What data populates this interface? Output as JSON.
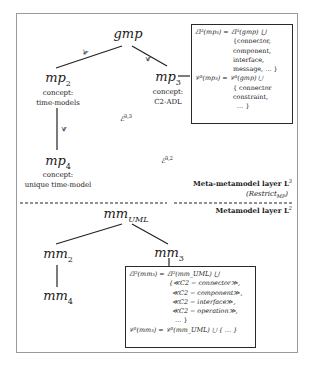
{
  "meta_layer": {
    "label": "Meta-metamodel layer L",
    "label_sup": "3",
    "restrict": "(Restrict",
    "restrict_sub": "MP",
    "restrict_close": ")",
    "nodes": {
      "gmp": {
        "name": "gmp"
      },
      "mp2": {
        "name": "mp",
        "sub": "2",
        "concept_label": "concept:",
        "concept": "time-models"
      },
      "mp3": {
        "name": "mp",
        "sub": "3",
        "concept_label": "concept:",
        "concept": "C2-ADL"
      },
      "mp4": {
        "name": "mp",
        "sub": "4",
        "concept_label": "concept:",
        "concept": "unique time-model"
      }
    },
    "edge_symbol": "≼",
    "edge_labels": [
      {
        "base": "ℰ",
        "sup": "3,3"
      },
      {
        "base": "ℰ",
        "sup": "3,2"
      }
    ],
    "definition_box": {
      "lines": [
        "ℰl³(mp₃) = ℰl³(gmp) ⋃",
        "{connector,",
        "component,",
        "interface,",
        "message, … }",
        "𝒞³(mp₃) = 𝒞³(gmp) ⋃",
        "{ connector",
        "constraint,",
        "… }"
      ]
    }
  },
  "metamodel_layer": {
    "label": "Metamodel layer L",
    "label_sup": "2",
    "nodes": {
      "mmUML": {
        "name": "mm",
        "sub": "UML"
      },
      "mm2": {
        "name": "mm",
        "sub": "2"
      },
      "mm3": {
        "name": "mm",
        "sub": "3"
      },
      "mm4": {
        "name": "mm",
        "sub": "4"
      }
    },
    "definition_box": {
      "lines": [
        "ℰl²(mm₃) = ℰl²(mm_UML) ⋃",
        "{≪C2 − connector≫,",
        "≪C2 − component≫,",
        "≪C2 − interface≫,",
        "≪C2 − operation≫,",
        "… }",
        "𝒞²(mm₃) = 𝒞²(mm_UML) ⋃ { … }"
      ]
    }
  }
}
